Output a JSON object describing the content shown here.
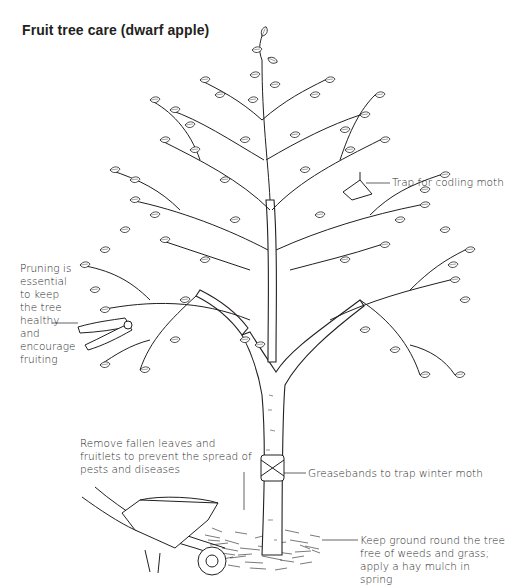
{
  "title": "Fruit tree care (dwarf apple)",
  "labels": {
    "pruning": "Pruning is essential to keep the tree healthy and encourage fruiting",
    "trap": "Trap for codling moth",
    "fallen": "Remove fallen leaves and fruitlets to prevent the spread of pests and diseases",
    "greasebands": "Greasebands to trap winter moth",
    "ground": "Keep ground round the tree free of weeds and grass; apply a hay mulch in spring"
  },
  "illustration": {
    "subject": "dwarf apple tree line drawing",
    "elements": [
      "tree-crown",
      "trunk",
      "grease-band",
      "codling-moth-trap",
      "pruning-shears",
      "wheelbarrow",
      "hay-mulch"
    ],
    "line_color": "#231f20",
    "background": "#ffffff"
  }
}
